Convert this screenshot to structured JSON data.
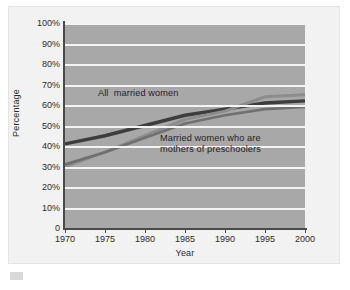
{
  "axes": {
    "ylabel": "Percentage",
    "xlabel": "Year",
    "yticks": [
      "100%",
      "90%",
      "80%",
      "70%",
      "60%",
      "50%",
      "40%",
      "30%",
      "20%",
      "10%",
      "0"
    ],
    "xticks": [
      "1970",
      "1975",
      "1980",
      "1985",
      "1990",
      "1995",
      "2000"
    ]
  },
  "annotations": {
    "all_married_women": "All  married women",
    "mothers_line1": "Married women who are",
    "mothers_line2": "mothers of preschoolers"
  },
  "colors": {
    "plot_background": "#a8a8a8",
    "figure_background": "#f2f2f2",
    "gridline": "#f4f4f4",
    "axis": "#4a4a4a",
    "series_all_married": "#3d3d3d",
    "series_mothers": "#8c8c8c",
    "series_third": "#707070"
  },
  "chart_data": {
    "type": "line",
    "title": "",
    "xlabel": "Year",
    "ylabel": "Percentage",
    "xlim": [
      1970,
      2000
    ],
    "ylim": [
      0,
      100
    ],
    "grid": true,
    "legend": "inline-annotations",
    "x": [
      1970,
      1975,
      1980,
      1985,
      1990,
      1995,
      2000
    ],
    "series": [
      {
        "name": "All married women",
        "color": "#3d3d3d",
        "values": [
          41,
          45,
          50,
          55,
          58,
          61,
          62
        ]
      },
      {
        "name": "Married women who are mothers of preschoolers",
        "color": "#8c8c8c",
        "values": [
          30,
          37,
          45,
          53,
          57,
          64,
          65
        ]
      },
      {
        "name": "Married women who are mothers of preschoolers (lower)",
        "color": "#707070",
        "values": [
          31,
          37,
          44,
          51,
          55,
          58,
          59
        ]
      }
    ]
  }
}
